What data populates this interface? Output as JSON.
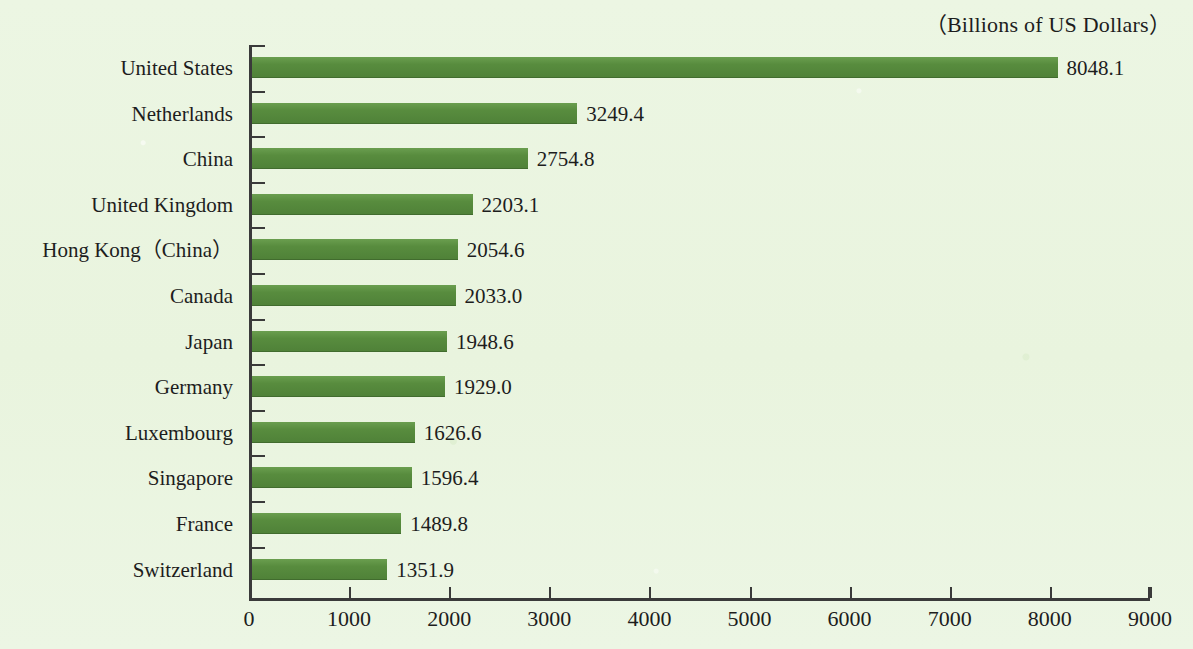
{
  "chart_data": {
    "type": "bar",
    "orientation": "horizontal",
    "title": "（Billions of US Dollars）",
    "xlabel": "",
    "ylabel": "",
    "xlim": [
      0,
      9000
    ],
    "xticks": [
      0,
      1000,
      2000,
      3000,
      4000,
      5000,
      6000,
      7000,
      8000,
      9000
    ],
    "xtick_labels": [
      "0",
      "1000",
      "2000",
      "3000",
      "4000",
      "5000",
      "6000",
      "7000",
      "8000",
      "9000"
    ],
    "grid": false,
    "legend": false,
    "bar_color": "#558b3e",
    "background_color": "#eaf5e0",
    "axis_color": "#3a3a3a",
    "text_color": "#1d1d1d",
    "categories": [
      "United States",
      "Netherlands",
      "China",
      "United Kingdom",
      "Hong Kong（China）",
      "Canada",
      "Japan",
      "Germany",
      "Luxembourg",
      "Singapore",
      "France",
      "Switzerland"
    ],
    "values": [
      8048.1,
      3249.4,
      2754.8,
      2203.1,
      2054.6,
      2033.0,
      1948.6,
      1929.0,
      1626.6,
      1596.4,
      1489.8,
      1351.9
    ],
    "value_labels": [
      "8048.1",
      "3249.4",
      "2754.8",
      "2203.1",
      "2054.6",
      "2033.0",
      "1948.6",
      "1929.0",
      "1626.6",
      "1596.4",
      "1489.8",
      "1351.9"
    ]
  }
}
